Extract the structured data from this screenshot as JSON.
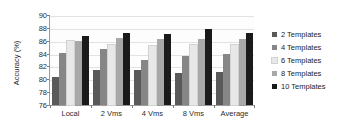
{
  "chart_data": {
    "type": "bar",
    "title": "",
    "xlabel": "",
    "ylabel": "Accuracy (%)",
    "ylim": [
      76,
      90
    ],
    "ytick_step": 2,
    "yticks": [
      90,
      88,
      86,
      84,
      82,
      80,
      78,
      76
    ],
    "grid": true,
    "legend_position": "right",
    "categories": [
      "Local",
      "2 Vms",
      "4 Vms",
      "8 Vms",
      "Average"
    ],
    "series": [
      {
        "name": "2 Templates",
        "color": "#595959",
        "values": [
          80.4,
          81.5,
          81.5,
          81.0,
          81.2
        ]
      },
      {
        "name": "4 Templates",
        "color": "#868686",
        "values": [
          84.1,
          84.7,
          83.0,
          83.6,
          83.9
        ]
      },
      {
        "name": "6 Templates",
        "color": "#e8e8e8",
        "values": [
          85.9,
          85.4,
          85.2,
          85.3,
          85.4
        ]
      },
      {
        "name": "8 Templates",
        "color": "#a8a8a8",
        "values": [
          86.0,
          86.5,
          86.3,
          86.2,
          86.3
        ]
      },
      {
        "name": "10 Templates",
        "color": "#1a1a1a",
        "values": [
          86.7,
          87.2,
          87.0,
          87.8,
          87.2
        ]
      }
    ]
  },
  "legend": {
    "items": [
      {
        "label": "2 Templates",
        "color": "#595959"
      },
      {
        "label": "4 Templates",
        "color": "#868686"
      },
      {
        "label": "6 Templates",
        "color": "#e8e8e8"
      },
      {
        "label": "8 Templates",
        "color": "#a8a8a8"
      },
      {
        "label": "10 Templates",
        "color": "#1a1a1a"
      }
    ]
  },
  "axis": {
    "y_title": "Accuracy (%)"
  }
}
